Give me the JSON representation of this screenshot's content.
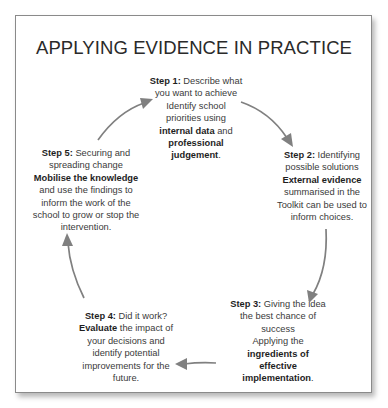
{
  "title": "APPLYING EVIDENCE IN PRACTICE",
  "colors": {
    "frame_border": "#8a8a8a",
    "arrow": "#808080",
    "text": "#3a3a3a",
    "background": "#ffffff"
  },
  "steps": [
    {
      "id": 1,
      "label": "Step 1:",
      "lines": [
        [
          {
            "t": "Step 1:",
            "b": true
          },
          {
            "t": " Describe what",
            "b": false
          }
        ],
        [
          {
            "t": "you want to achieve",
            "b": false
          }
        ],
        [
          {
            "t": "Identify school",
            "b": false
          }
        ],
        [
          {
            "t": "priorities using",
            "b": false
          }
        ],
        [
          {
            "t": "internal data",
            "b": true
          },
          {
            "t": " and",
            "b": false
          }
        ],
        [
          {
            "t": "professional",
            "b": true
          }
        ],
        [
          {
            "t": "judgement",
            "b": true
          },
          {
            "t": ".",
            "b": false
          }
        ]
      ]
    },
    {
      "id": 2,
      "label": "Step 2:",
      "lines": [
        [
          {
            "t": "Step 2:",
            "b": true
          },
          {
            "t": " Identifying",
            "b": false
          }
        ],
        [
          {
            "t": "possible solutions",
            "b": false
          }
        ],
        [
          {
            "t": "External evidence",
            "b": true
          }
        ],
        [
          {
            "t": "summarised in the",
            "b": false
          }
        ],
        [
          {
            "t": "Toolkit can be used to",
            "b": false
          }
        ],
        [
          {
            "t": "inform choices.",
            "b": false
          }
        ]
      ]
    },
    {
      "id": 3,
      "label": "Step 3:",
      "lines": [
        [
          {
            "t": "Step 3:",
            "b": true
          },
          {
            "t": " Giving the idea",
            "b": false
          }
        ],
        [
          {
            "t": "the best chance of",
            "b": false
          }
        ],
        [
          {
            "t": "success",
            "b": false
          }
        ],
        [
          {
            "t": "Applying the",
            "b": false
          }
        ],
        [
          {
            "t": "ingredients of",
            "b": true
          }
        ],
        [
          {
            "t": "effective",
            "b": true
          }
        ],
        [
          {
            "t": "implementation",
            "b": true
          },
          {
            "t": ".",
            "b": false
          }
        ]
      ]
    },
    {
      "id": 4,
      "label": "Step 4:",
      "lines": [
        [
          {
            "t": "Step 4:",
            "b": true
          },
          {
            "t": " Did it work?",
            "b": false
          }
        ],
        [
          {
            "t": "Evaluate",
            "b": true
          },
          {
            "t": " the impact of",
            "b": false
          }
        ],
        [
          {
            "t": "your decisions and",
            "b": false
          }
        ],
        [
          {
            "t": "identify potential",
            "b": false
          }
        ],
        [
          {
            "t": "improvements for the",
            "b": false
          }
        ],
        [
          {
            "t": "future.",
            "b": false
          }
        ]
      ]
    },
    {
      "id": 5,
      "label": "Step 5:",
      "lines": [
        [
          {
            "t": "Step 5:",
            "b": true
          },
          {
            "t": " Securing and",
            "b": false
          }
        ],
        [
          {
            "t": "spreading change",
            "b": false
          }
        ],
        [
          {
            "t": "Mobilise the knowledge",
            "b": true
          }
        ],
        [
          {
            "t": "and use the findings to",
            "b": false
          }
        ],
        [
          {
            "t": "inform the work of the",
            "b": false
          }
        ],
        [
          {
            "t": "school to grow or stop the",
            "b": false
          }
        ],
        [
          {
            "t": "intervention.",
            "b": false
          }
        ]
      ]
    }
  ],
  "arrows": [
    {
      "from": 1,
      "to": 2,
      "icon": "curved-arrow-icon"
    },
    {
      "from": 2,
      "to": 3,
      "icon": "curved-arrow-icon"
    },
    {
      "from": 3,
      "to": 4,
      "icon": "curved-arrow-icon"
    },
    {
      "from": 4,
      "to": 5,
      "icon": "curved-arrow-icon"
    },
    {
      "from": 5,
      "to": 1,
      "icon": "curved-arrow-icon"
    }
  ]
}
